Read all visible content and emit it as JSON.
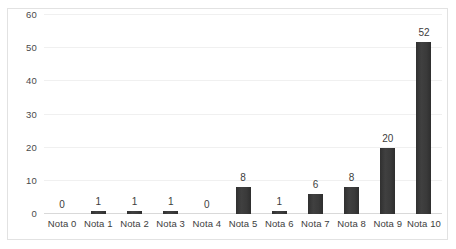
{
  "chart_data": {
    "type": "bar",
    "title": "",
    "subtitle": "",
    "xlabel": "",
    "ylabel": "",
    "categories": [
      "Nota 0",
      "Nota 1",
      "Nota 2",
      "Nota 3",
      "Nota 4",
      "Nota 5",
      "Nota 6",
      "Nota 7",
      "Nota 8",
      "Nota 9",
      "Nota 10"
    ],
    "values": [
      0,
      1,
      1,
      1,
      0,
      8,
      1,
      6,
      8,
      20,
      52
    ],
    "data_labels": [
      "0",
      "1",
      "1",
      "1",
      "0",
      "8",
      "1",
      "6",
      "8",
      "20",
      "52"
    ],
    "ylim": [
      0,
      60
    ],
    "yticks": [
      0,
      10,
      20,
      30,
      40,
      50,
      60
    ],
    "ytick_labels": [
      "0",
      "10",
      "20",
      "30",
      "40",
      "50",
      "60"
    ],
    "grid": "horizontal",
    "legend": "none",
    "series": [
      {
        "name": "",
        "values": [
          0,
          1,
          1,
          1,
          0,
          8,
          1,
          6,
          8,
          20,
          52
        ],
        "color": "#3a3a3a"
      }
    ],
    "colors": {
      "bar": "#3a3a3a",
      "gridline": "#f0f0f0",
      "baseline": "#d9d9d9",
      "border": "#e2e2e2",
      "text": "#3d3d3d",
      "background": "#ffffff"
    }
  }
}
